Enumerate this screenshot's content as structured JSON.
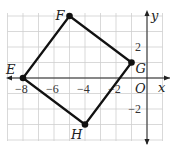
{
  "diagram": {
    "type": "coordinate-plane-quadrilateral",
    "axes": {
      "x_label": "x",
      "y_label": "y",
      "origin_label": "O"
    },
    "x_ticks": [
      {
        "value": -8,
        "label": "−8"
      },
      {
        "value": -6,
        "label": "−6"
      },
      {
        "value": -4,
        "label": "−4"
      },
      {
        "value": -2,
        "label": "−2"
      }
    ],
    "y_ticks": [
      {
        "value": 2,
        "label": "2"
      },
      {
        "value": -2,
        "label": "−2"
      }
    ],
    "grid": {
      "x_min": -9,
      "x_max": 1,
      "y_min": -4,
      "y_max": 4,
      "step": 1
    },
    "points": [
      {
        "name": "E",
        "x": -8,
        "y": 0
      },
      {
        "name": "F",
        "x": -5,
        "y": 4
      },
      {
        "name": "G",
        "x": -1,
        "y": 1
      },
      {
        "name": "H",
        "x": -4,
        "y": -3
      }
    ],
    "colors": {
      "grid": "#cfcfcf",
      "polygon": "#111111",
      "axis": "#222222"
    }
  }
}
